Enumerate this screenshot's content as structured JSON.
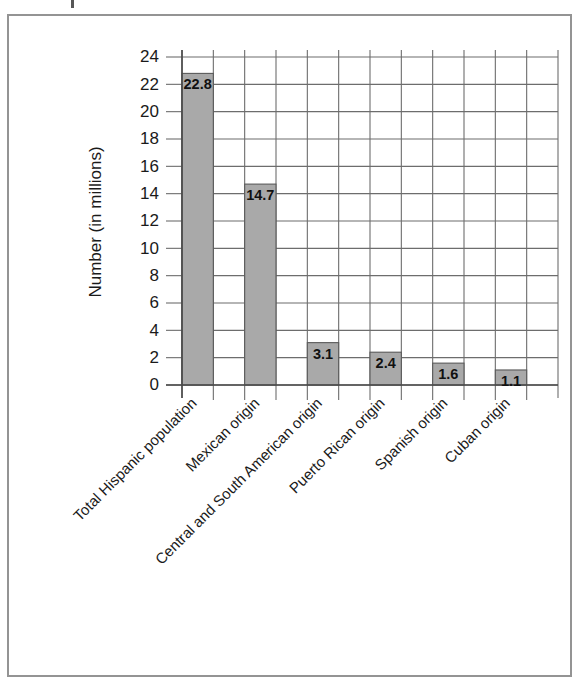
{
  "chart_data": {
    "type": "bar",
    "title": "",
    "xlabel": "",
    "ylabel": "Number (in millions)",
    "ylim": [
      0,
      24
    ],
    "ytick_step": 2,
    "yticks": [
      "24",
      "22",
      "20",
      "18",
      "16",
      "14",
      "12",
      "10",
      "8",
      "6",
      "4",
      "2",
      "0"
    ],
    "grid": true,
    "legend": "none",
    "orientation": "vertical",
    "value_label_position": "inside-top",
    "category_label_rotation_deg": 45,
    "bar_color": "#a9a9a9",
    "bar_edge_color": "#5a5a5a",
    "grid_color": "#6d6d6d",
    "axis_color": "#4a4a4a",
    "frame_color": "#949494",
    "categories": [
      "Total Hispanic population",
      "Mexican origin",
      "Central and South American origin",
      "Puerto Rican origin",
      "Spanish origin",
      "Cuban origin"
    ],
    "values": [
      22.8,
      14.7,
      3.1,
      2.4,
      1.6,
      1.1
    ],
    "value_labels": [
      "22.8",
      "14.7",
      "3.1",
      "2.4",
      "1.6",
      "1.1"
    ]
  }
}
